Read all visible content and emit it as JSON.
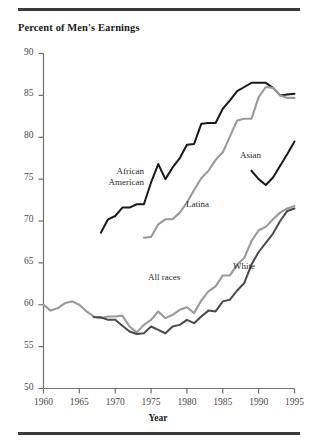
{
  "figure": {
    "title": "Percent  of Men's Earnings",
    "xaxis_title": "Year",
    "rule_color": "#3a3a3a"
  },
  "axes": {
    "y_ticks": [
      "90",
      "85",
      "80",
      "75",
      "70",
      "65",
      "60",
      "55",
      "50"
    ],
    "x_ticks": [
      "1960",
      "1965",
      "1970",
      "1975",
      "1980",
      "1985",
      "1990",
      "1995"
    ]
  },
  "series_labels": {
    "african_american_line1": "African",
    "african_american_line2": "American",
    "latina": "Latina",
    "asian": "Asian",
    "all_races": "All races",
    "white": "White"
  },
  "colors": {
    "dark": "#1a1a1a",
    "gray": "#9a9a9a",
    "axis": "#707070",
    "text": "#2a2a2a"
  },
  "chart_data": {
    "type": "line",
    "title": "Percent  of Men's Earnings",
    "xlabel": "Year",
    "ylabel": "Percent of Men's Earnings",
    "xlim": [
      1960,
      1995
    ],
    "ylim": [
      50,
      90
    ],
    "y_ticks": [
      50,
      55,
      60,
      65,
      70,
      75,
      80,
      85,
      90
    ],
    "x_ticks": [
      1960,
      1965,
      1970,
      1975,
      1980,
      1985,
      1990,
      1995
    ],
    "grid": false,
    "legend": "inline-labels",
    "series": [
      {
        "name": "African American",
        "color": "#1a1a1a",
        "x": [
          1968,
          1969,
          1970,
          1971,
          1972,
          1973,
          1974,
          1975,
          1976,
          1977,
          1978,
          1979,
          1980,
          1981,
          1982,
          1983,
          1984,
          1985,
          1986,
          1987,
          1988,
          1989,
          1990,
          1991,
          1992,
          1993,
          1994,
          1995
        ],
        "values": [
          68.6,
          70.2,
          70.6,
          71.6,
          71.6,
          72.0,
          72.0,
          74.6,
          76.8,
          75.0,
          76.4,
          77.5,
          79.1,
          79.2,
          81.6,
          81.7,
          81.7,
          83.4,
          84.4,
          85.5,
          86.0,
          86.5,
          86.5,
          86.5,
          85.9,
          85.0,
          85.1,
          85.2
        ]
      },
      {
        "name": "Latina",
        "color": "#9a9a9a",
        "x": [
          1974,
          1975,
          1976,
          1977,
          1978,
          1979,
          1980,
          1981,
          1982,
          1983,
          1984,
          1985,
          1986,
          1987,
          1988,
          1989,
          1990,
          1991,
          1992,
          1993,
          1994,
          1995
        ],
        "values": [
          68.0,
          68.1,
          69.6,
          70.2,
          70.2,
          71.0,
          72.2,
          73.7,
          75.1,
          76.0,
          77.3,
          78.2,
          80.1,
          82.0,
          82.2,
          82.2,
          84.8,
          86.0,
          85.9,
          85.0,
          84.7,
          84.7
        ]
      },
      {
        "name": "Asian",
        "color": "#1a1a1a",
        "x": [
          1989,
          1990,
          1991,
          1992,
          1993,
          1994,
          1995
        ],
        "values": [
          76.0,
          75.0,
          74.3,
          75.2,
          76.6,
          78.0,
          79.5
        ]
      },
      {
        "name": "All races",
        "color": "#9a9a9a",
        "x": [
          1960,
          1961,
          1962,
          1963,
          1964,
          1965,
          1966,
          1967,
          1968,
          1969,
          1970,
          1971,
          1972,
          1973,
          1974,
          1975,
          1976,
          1977,
          1978,
          1979,
          1980,
          1981,
          1982,
          1983,
          1984,
          1985,
          1986,
          1987,
          1988,
          1989,
          1990,
          1991,
          1992,
          1993,
          1994,
          1995
        ],
        "values": [
          60.0,
          59.3,
          59.6,
          60.2,
          60.4,
          60.0,
          59.2,
          58.6,
          58.4,
          58.6,
          58.6,
          58.7,
          57.4,
          56.7,
          57.6,
          58.2,
          59.2,
          58.4,
          58.8,
          59.4,
          59.7,
          59.0,
          60.5,
          61.6,
          62.2,
          63.5,
          63.5,
          64.8,
          65.6,
          67.6,
          68.9,
          69.3,
          70.2,
          71.0,
          71.5,
          71.8
        ]
      },
      {
        "name": "White",
        "color": "#4a4a4a",
        "x": [
          1967,
          1968,
          1969,
          1970,
          1971,
          1972,
          1973,
          1974,
          1975,
          1976,
          1977,
          1978,
          1979,
          1980,
          1981,
          1982,
          1983,
          1984,
          1985,
          1986,
          1987,
          1988,
          1989,
          1990,
          1991,
          1992,
          1993,
          1994,
          1995
        ],
        "values": [
          58.5,
          58.5,
          58.2,
          58.2,
          57.5,
          56.8,
          56.5,
          56.6,
          57.4,
          57.0,
          56.6,
          57.4,
          57.6,
          58.2,
          57.8,
          58.6,
          59.3,
          59.2,
          60.4,
          60.6,
          61.7,
          62.6,
          64.8,
          66.3,
          67.4,
          68.5,
          70.0,
          71.2,
          71.5
        ]
      }
    ]
  }
}
